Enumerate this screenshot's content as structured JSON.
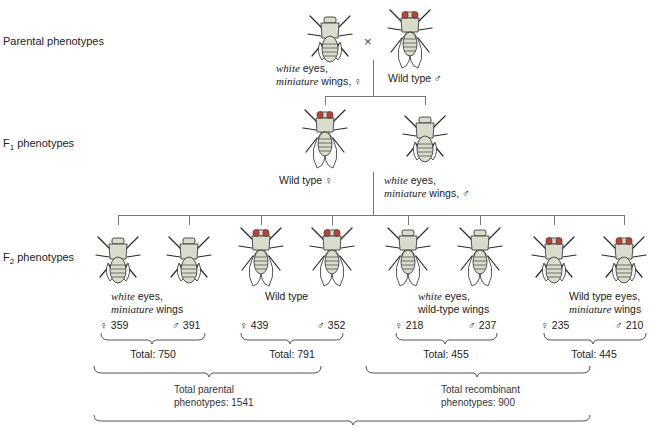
{
  "rows": {
    "parental": {
      "label": "Parental phenotypes"
    },
    "f1": {
      "label_main": "F",
      "label_sub": "1",
      "label_rest": " phenotypes"
    },
    "f2": {
      "label_main": "F",
      "label_sub": "2",
      "label_rest": " phenotypes"
    }
  },
  "parental": {
    "cross_symbol": "×",
    "female": {
      "line1_italic": "white",
      "line1_rest": " eyes,",
      "line2_italic": "miniature",
      "line2_rest": " wings, ♀"
    },
    "male": {
      "label": "Wild type ♂"
    }
  },
  "f1": {
    "female": {
      "label": "Wild type ♀"
    },
    "male": {
      "line1_italic": "white",
      "line1_rest": " eyes,",
      "line2_italic": "miniature",
      "line2_rest": " wings, ♂"
    }
  },
  "f2": {
    "groups": [
      {
        "line1_italic": "white",
        "line1_rest": " eyes,",
        "line2_italic": "miniature",
        "line2_rest": " wings",
        "female_count": "♀ 359",
        "male_count": "♂ 391",
        "total": "Total: 750"
      },
      {
        "line1_italic": "",
        "line1_rest": "Wild type",
        "line2_italic": "",
        "line2_rest": "",
        "female_count": "♀ 439",
        "male_count": "♂ 352",
        "total": "Total: 791"
      },
      {
        "line1_italic": "white",
        "line1_rest": " eyes,",
        "line2_italic": "",
        "line2_rest": "wild-type wings",
        "female_count": "♀ 218",
        "male_count": "♂ 237",
        "total": "Total: 455"
      },
      {
        "line1_italic": "",
        "line1_rest": "Wild type eyes,",
        "line2_italic": "miniature",
        "line2_rest": " wings",
        "female_count": "♀ 235",
        "male_count": "♂ 210",
        "total": "Total: 445"
      }
    ],
    "parental_total": {
      "line1": "Total parental",
      "line2": "phenotypes: 1541"
    },
    "recombinant_total": {
      "line1": "Total recombinant",
      "line2": "phenotypes: 900"
    }
  },
  "colors": {
    "body": "#d9dccb",
    "outline": "#2a2a2a",
    "eye_red": "#b5453a",
    "line": "#777777"
  }
}
